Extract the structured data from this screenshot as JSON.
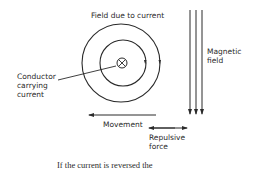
{
  "diagram": {
    "type": "physics-diagram",
    "labels": {
      "field_due_to_current": "Field due to current",
      "magnetic_field_line1": "Magnetic",
      "magnetic_field_line2": "field",
      "conductor_line1": "Conductor",
      "conductor_line2": "carrying",
      "conductor_line3": "current",
      "movement": "Movement",
      "repulsive_line1": "Repulsive",
      "repulsive_line2": "force"
    },
    "caption": "If the current is reversed the",
    "conductor_symbol": "cross-in-circle (current into page)",
    "elements": {
      "field_circles": 2,
      "magnetic_field_lines": 3,
      "magnetic_field_direction": "down",
      "movement_direction": "left",
      "repulsive_force_direction": "both"
    },
    "colors": {
      "line": "#2a2a2a",
      "background": "#ffffff"
    }
  }
}
